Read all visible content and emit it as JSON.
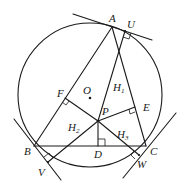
{
  "diagram": {
    "type": "geometry",
    "colors": {
      "ink": "#1a1a1a",
      "background": "#ffffff"
    },
    "circle": {
      "center_label": "O",
      "cx": 90,
      "cy": 95,
      "r": 72
    },
    "points": {
      "A": {
        "label": "A",
        "x": 112,
        "y": 27
      },
      "U": {
        "label": "U",
        "x": 125,
        "y": 31
      },
      "B": {
        "label": "B",
        "x": 34,
        "y": 146
      },
      "C": {
        "label": "C",
        "x": 146,
        "y": 146
      },
      "O": {
        "label": "O",
        "x": 90,
        "y": 98
      },
      "P": {
        "label": "P",
        "x": 98,
        "y": 121
      },
      "D": {
        "label": "D",
        "x": 98,
        "y": 146
      },
      "E": {
        "label": "E",
        "x": 135,
        "y": 107
      },
      "F": {
        "label": "F",
        "x": 65,
        "y": 98
      },
      "V": {
        "label": "V",
        "x": 48,
        "y": 162
      },
      "W": {
        "label": "W",
        "x": 139,
        "y": 155
      }
    },
    "region_labels": {
      "H1": {
        "main": "H",
        "sub": "1"
      },
      "H2": {
        "main": "H",
        "sub": "2"
      },
      "H3": {
        "main": "H",
        "sub": "3"
      }
    },
    "right_angles": [
      "F",
      "E",
      "D",
      "U",
      "V",
      "W"
    ],
    "segments": [
      "AB",
      "AC",
      "BC",
      "PF",
      "PE",
      "PD",
      "PU",
      "PV",
      "PW",
      "AU tangent",
      "BV tangent",
      "CW tangent"
    ]
  }
}
